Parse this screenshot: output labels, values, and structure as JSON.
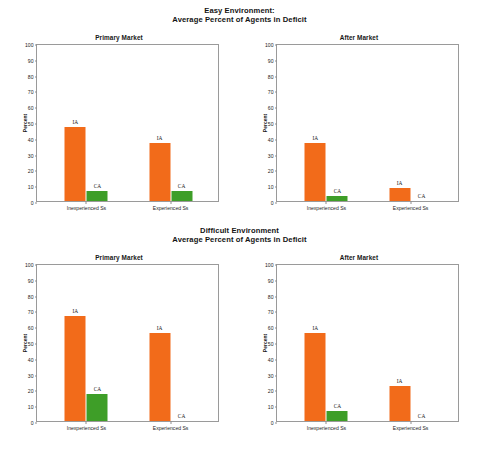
{
  "figure": {
    "width": 479,
    "height": 453,
    "background": "#ffffff"
  },
  "titles": {
    "top_line1": "Easy Environment:",
    "top_line2": "Average Percent of Agents in Deficit",
    "bottom_line1": "Difficult Environment",
    "bottom_line2": "Average Percent of Agents in Deficit"
  },
  "colors": {
    "ia_orange": "#F26B1A",
    "ca_green": "#3E9E28",
    "axis": "#9a9a9a",
    "text": "#1a1a1a"
  },
  "axis": {
    "ylabel": "Percent",
    "yticks": [
      0,
      10,
      20,
      30,
      40,
      50,
      60,
      70,
      80,
      90,
      100
    ],
    "ylim": [
      0,
      100
    ],
    "categories": [
      "Inexperienced Ss",
      "Experienced Ss"
    ],
    "series_labels": [
      "IA",
      "CA"
    ]
  },
  "chart_data": [
    {
      "type": "bar",
      "title": "Primary Market",
      "suptitle": "Easy Environment: Average Percent of Agents in Deficit",
      "panel": "easy-primary-market",
      "xlabel": "",
      "ylabel": "Percent",
      "ylim": [
        0,
        100
      ],
      "grid": false,
      "legend": "in-plot data labels",
      "categories": [
        "Inexperienced Ss",
        "Experienced Ss"
      ],
      "series": [
        {
          "name": "IA",
          "color": "#F26B1A",
          "values": [
            47,
            37
          ]
        },
        {
          "name": "CA",
          "color": "#3E9E28",
          "values": [
            6.5,
            6.5
          ]
        }
      ]
    },
    {
      "type": "bar",
      "title": "After Market",
      "suptitle": "Easy Environment: Average Percent of Agents in Deficit",
      "panel": "easy-after-market",
      "xlabel": "",
      "ylabel": "Percent",
      "ylim": [
        0,
        100
      ],
      "grid": false,
      "legend": "in-plot data labels",
      "categories": [
        "Inexperienced Ss",
        "Experienced Ss"
      ],
      "series": [
        {
          "name": "IA",
          "color": "#F26B1A",
          "values": [
            36.5,
            8
          ]
        },
        {
          "name": "CA",
          "color": "#3E9E28",
          "values": [
            3,
            0
          ]
        }
      ]
    },
    {
      "type": "bar",
      "title": "Primary Market",
      "suptitle": "Difficult Environment Average Percent of Agents in Deficit",
      "panel": "difficult-primary-market",
      "xlabel": "",
      "ylabel": "Percent",
      "ylim": [
        0,
        100
      ],
      "grid": false,
      "legend": "in-plot data labels",
      "categories": [
        "Inexperienced Ss",
        "Experienced Ss"
      ],
      "series": [
        {
          "name": "IA",
          "color": "#F26B1A",
          "values": [
            66.5,
            55.5
          ]
        },
        {
          "name": "CA",
          "color": "#3E9E28",
          "values": [
            17,
            0
          ]
        }
      ]
    },
    {
      "type": "bar",
      "title": "After Market",
      "suptitle": "Difficult Environment Average Percent of Agents in Deficit",
      "panel": "difficult-after-market",
      "xlabel": "",
      "ylabel": "Percent",
      "ylim": [
        0,
        100
      ],
      "grid": false,
      "legend": "in-plot data labels",
      "categories": [
        "Inexperienced Ss",
        "Experienced Ss"
      ],
      "series": [
        {
          "name": "IA",
          "color": "#F26B1A",
          "values": [
            55.5,
            22
          ]
        },
        {
          "name": "CA",
          "color": "#3E9E28",
          "values": [
            6.5,
            0
          ]
        }
      ]
    }
  ]
}
